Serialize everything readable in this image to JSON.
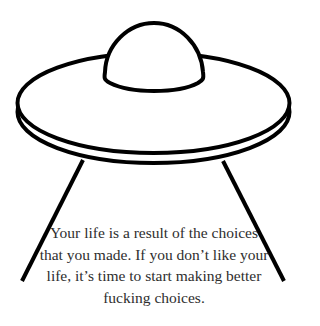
{
  "illustration": {
    "subject": "ufo-line-drawing",
    "stroke_color": "#000000",
    "fill_color": "#ffffff",
    "background_color": "#ffffff"
  },
  "quote": {
    "lines": [
      "Your life is a result of the choices",
      "that you made. If you don’t like your",
      "life, it’s time to start making better",
      "fucking choices."
    ],
    "text_color": "#2e2e2e"
  }
}
